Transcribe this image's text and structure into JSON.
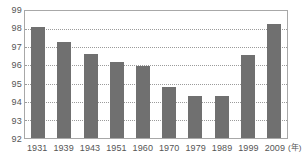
{
  "chart_data": {
    "type": "bar",
    "title": "",
    "subtitle": "",
    "xlabel": "",
    "ylabel": "",
    "x_unit_label": "(年)",
    "categories": [
      "1931",
      "1939",
      "1943",
      "1951",
      "1960",
      "1970",
      "1979",
      "1989",
      "1999",
      "2009"
    ],
    "values": [
      98.05,
      97.2,
      96.55,
      96.1,
      95.9,
      94.75,
      94.3,
      94.3,
      96.5,
      98.2
    ],
    "series": [
      {
        "name": "",
        "values": [
          98.05,
          97.2,
          96.55,
          96.1,
          95.9,
          94.75,
          94.3,
          94.3,
          96.5,
          98.2
        ]
      }
    ],
    "ylim": [
      92,
      99
    ],
    "y_ticks": [
      "99",
      "98",
      "97",
      "96",
      "95",
      "94",
      "93",
      "92"
    ],
    "y_tick_values": [
      99,
      98,
      97,
      96,
      95,
      94,
      93,
      92
    ],
    "grid": true,
    "grid_style": "dotted-horizontal",
    "legend": "none",
    "bar_color": "#707070",
    "grid_color": "#9b9b9b",
    "axis_color": "#a8a8a8",
    "text_color": "#555555",
    "background_color": "#ffffff"
  }
}
